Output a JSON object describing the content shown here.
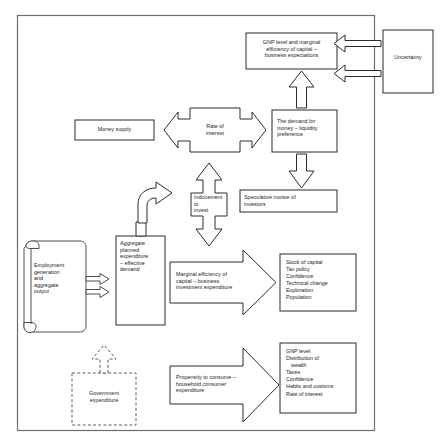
{
  "diagram": {
    "frame": {
      "label": "main-diagram-frame"
    },
    "nodes": {
      "uncertainty": {
        "label": "Uncertainty"
      },
      "gnp_marginal": {
        "label": "GNP level and marginal\nefficiency of capital –\nbusiness expectations"
      },
      "money_supply": {
        "label": "Money supply"
      },
      "rate_of_interest": {
        "label": "Rate of\ninterest"
      },
      "demand_for_money": {
        "label": "The demand for\nmoney – liquidity\npreference"
      },
      "inducement_to_invest": {
        "label": "Inducement to\ninvest"
      },
      "speculative_motive": {
        "label": "Speculative motive of\ninvestors"
      },
      "employment_generation": {
        "label": "Employment\ngeneration\nand\naggregate\noutput"
      },
      "aggregate_planned_expenditure": {
        "label": "Aggregate\nplanned\nexpenditure\n– effective\ndemand"
      },
      "marginal_efficiency_arrow": {
        "label": "Marginal efficiency of\ncapital – business\ninvestment expenditure"
      },
      "propensity_to_consume_arrow": {
        "label": "Propensity to consume –\nhousehold consumer\nexpenditure"
      },
      "government_expenditure": {
        "label": "Government\nexpenditure"
      },
      "investment_determinants": {
        "items": [
          "Stock of capital",
          "Tax policy",
          "Confidence",
          "Technical change",
          "Exploration",
          "Population"
        ]
      },
      "consumption_determinants": {
        "items": [
          "GNP level",
          "Distribution of",
          "wealth",
          "Taxes",
          "Confidence",
          "Habits and customs",
          "Rate of interest"
        ]
      }
    },
    "colors": {
      "stroke": "#2b2b2b",
      "frame": "#6e6e6e",
      "text": "#1c1c1c",
      "background": "#ffffff"
    }
  }
}
